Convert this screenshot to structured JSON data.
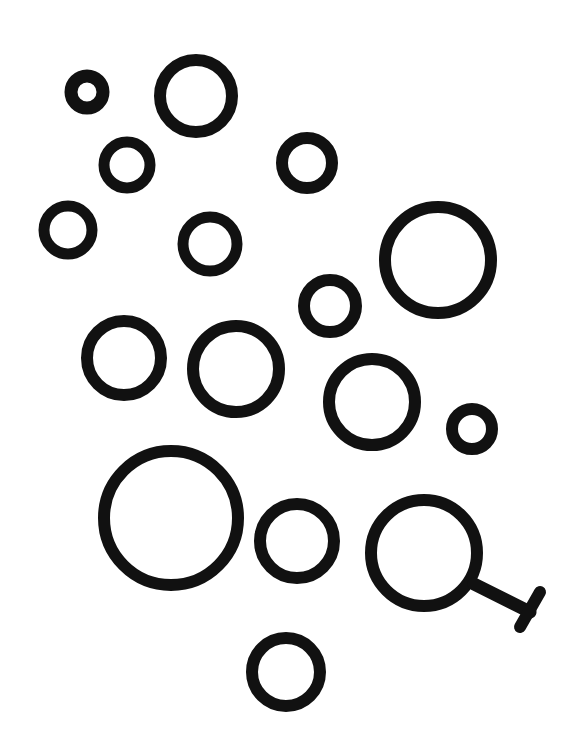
{
  "drawing": {
    "title": "Hand-drawn circles",
    "background": "#ffffff",
    "ink": "#111111",
    "circles": [
      {
        "id": "c1",
        "cx": 87,
        "cy": 92,
        "r": 16,
        "stroke": 13
      },
      {
        "id": "c2",
        "cx": 196,
        "cy": 96,
        "r": 36,
        "stroke": 12
      },
      {
        "id": "c3",
        "cx": 127,
        "cy": 165,
        "r": 23,
        "stroke": 11
      },
      {
        "id": "c4",
        "cx": 307,
        "cy": 163,
        "r": 25,
        "stroke": 12
      },
      {
        "id": "c5",
        "cx": 68,
        "cy": 230,
        "r": 24,
        "stroke": 11
      },
      {
        "id": "c6",
        "cx": 210,
        "cy": 244,
        "r": 27,
        "stroke": 11
      },
      {
        "id": "c7",
        "cx": 438,
        "cy": 260,
        "r": 53,
        "stroke": 12
      },
      {
        "id": "c8",
        "cx": 330,
        "cy": 306,
        "r": 26,
        "stroke": 12
      },
      {
        "id": "c9",
        "cx": 124,
        "cy": 358,
        "r": 37,
        "stroke": 12
      },
      {
        "id": "c10",
        "cx": 236,
        "cy": 369,
        "r": 43,
        "stroke": 12
      },
      {
        "id": "c11",
        "cx": 372,
        "cy": 402,
        "r": 43,
        "stroke": 12
      },
      {
        "id": "c12",
        "cx": 472,
        "cy": 429,
        "r": 20,
        "stroke": 12
      },
      {
        "id": "c13",
        "cx": 171,
        "cy": 518,
        "r": 67,
        "stroke": 12
      },
      {
        "id": "c14",
        "cx": 297,
        "cy": 541,
        "r": 37,
        "stroke": 12
      },
      {
        "id": "c15",
        "cx": 424,
        "cy": 553,
        "r": 53,
        "stroke": 12
      },
      {
        "id": "c16",
        "cx": 286,
        "cy": 672,
        "r": 34,
        "stroke": 12
      }
    ],
    "magnifier_handle": {
      "attached_to": "c15",
      "handle": {
        "x1": 474,
        "y1": 584,
        "x2": 530,
        "y2": 612,
        "stroke": 13
      },
      "crossbar": {
        "x1": 540,
        "y1": 592,
        "x2": 520,
        "y2": 627,
        "stroke": 12
      }
    }
  }
}
